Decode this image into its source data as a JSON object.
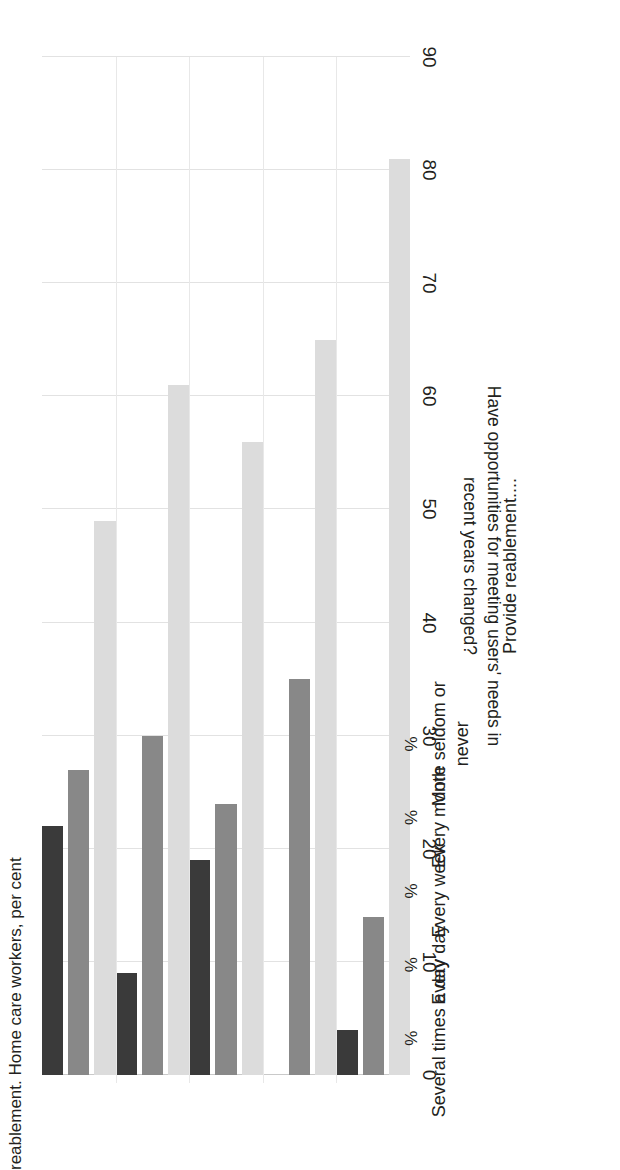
{
  "chart_data": {
    "type": "bar",
    "orientation": "horizontal-rotated",
    "title": "reablement. Home care workers, per cent",
    "xlabel": "Provide reablement....",
    "ylabel": "Have opportunities for meeting users' needs in recent years changed?",
    "ylabel_line1": "Have opportunities for meeting users' needs in",
    "ylabel_line2": "recent years changed?",
    "unit_marker": "%",
    "categories": [
      "Several times a day",
      "Every day",
      "Every week",
      "Every month",
      "More seldom or\nnever"
    ],
    "series": [
      {
        "name": "series-dark",
        "color": "#3a3a3a",
        "values": [
          22,
          9,
          19,
          0,
          4
        ]
      },
      {
        "name": "series-medium",
        "color": "#888888",
        "values": [
          27,
          30,
          24,
          35,
          14
        ]
      },
      {
        "name": "series-light",
        "color": "#dcdcdc",
        "values": [
          49,
          61,
          56,
          65,
          81
        ]
      }
    ],
    "xlim": [
      0,
      90
    ],
    "xticks": [
      0,
      10,
      20,
      30,
      40,
      50,
      60,
      70,
      80,
      90
    ],
    "grid": true,
    "legend": "none"
  },
  "colors": {
    "dark": "#3a3a3a",
    "medium": "#888888",
    "light": "#dcdcdc",
    "grid": "#e2e2e2",
    "text": "#231f20"
  }
}
